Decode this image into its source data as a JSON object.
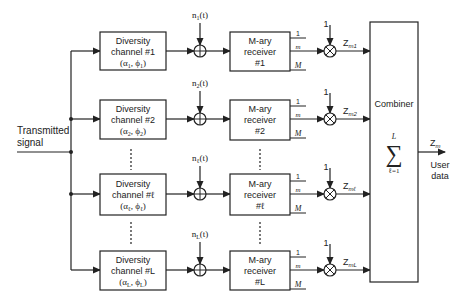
{
  "diagram": {
    "input_label_line1": "Transmitted",
    "input_label_line2": "signal",
    "channel_title": "Diversity",
    "receiver_title_line1": "M-ary",
    "receiver_title_line2": "receiver",
    "output_one": "1",
    "output_m": "m",
    "output_M": "M",
    "weight": "1",
    "branches": [
      {
        "channel_label": "channel #1",
        "params": "(α",
        "sub": "1",
        "phi": "1",
        "noise": "n",
        "noise_sub": "1",
        "receiver_id": "#1",
        "z_sub": "m1"
      },
      {
        "channel_label": "channel #2",
        "params": "(α",
        "sub": "2",
        "phi": "2",
        "noise": "n",
        "noise_sub": "2",
        "receiver_id": "#2",
        "z_sub": "m2"
      },
      {
        "channel_label": "channel #ℓ",
        "params": "(α",
        "sub": "ℓ",
        "phi": "ℓ",
        "noise": "n",
        "noise_sub": "ℓ",
        "receiver_id": "#ℓ",
        "z_sub": "mℓ"
      },
      {
        "channel_label": "channel #L",
        "params": "(α",
        "sub": "L",
        "phi": "L",
        "noise": "n",
        "noise_sub": "L",
        "receiver_id": "#L",
        "z_sub": "mL"
      }
    ],
    "combiner": {
      "title": "Combiner",
      "sum_symbol": "∑",
      "upper": "L",
      "lower": "ℓ=1"
    },
    "output": {
      "z": "Z",
      "z_sub": "m",
      "label_line1": "User",
      "label_line2": "data"
    },
    "ellipsis": "⋮"
  }
}
